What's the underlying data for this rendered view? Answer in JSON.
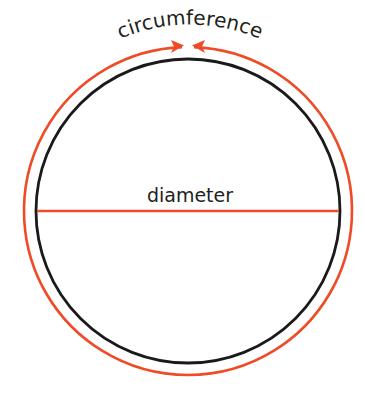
{
  "diagram": {
    "labels": {
      "circumference": "circumference",
      "diameter": "diameter"
    },
    "colors": {
      "circle": "#1a1a1a",
      "accent": "#ef4b27",
      "text": "#231f20",
      "background": "#ffffff"
    },
    "circle": {
      "cx": 188,
      "cy": 211,
      "r": 152
    },
    "circumference_arc": {
      "r": 164
    }
  }
}
